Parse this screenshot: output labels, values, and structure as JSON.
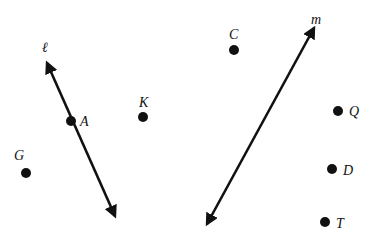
{
  "colors": {
    "ink": "#111111",
    "background": "#ffffff"
  },
  "lines": [
    {
      "name": "l",
      "label": "ℓ",
      "x1": 47,
      "y1": 63,
      "x2": 115,
      "y2": 216,
      "label_x": 42,
      "label_y": 52
    },
    {
      "name": "m",
      "label": "m",
      "x1": 314,
      "y1": 28,
      "x2": 207,
      "y2": 224,
      "label_x": 311,
      "label_y": 24
    }
  ],
  "points": [
    {
      "name": "A",
      "label": "A",
      "x": 71,
      "y": 121,
      "label_x": 80,
      "label_y": 126
    },
    {
      "name": "K",
      "label": "K",
      "x": 143,
      "y": 117,
      "label_x": 139,
      "label_y": 107
    },
    {
      "name": "G",
      "label": "G",
      "x": 26,
      "y": 173,
      "label_x": 14,
      "label_y": 160
    },
    {
      "name": "C",
      "label": "C",
      "x": 234,
      "y": 50,
      "label_x": 229,
      "label_y": 39
    },
    {
      "name": "Q",
      "label": "Q",
      "x": 338,
      "y": 111,
      "label_x": 349,
      "label_y": 116
    },
    {
      "name": "D",
      "label": "D",
      "x": 332,
      "y": 169,
      "label_x": 343,
      "label_y": 175
    },
    {
      "name": "T",
      "label": "T",
      "x": 325,
      "y": 222,
      "label_x": 336,
      "label_y": 228
    }
  ]
}
